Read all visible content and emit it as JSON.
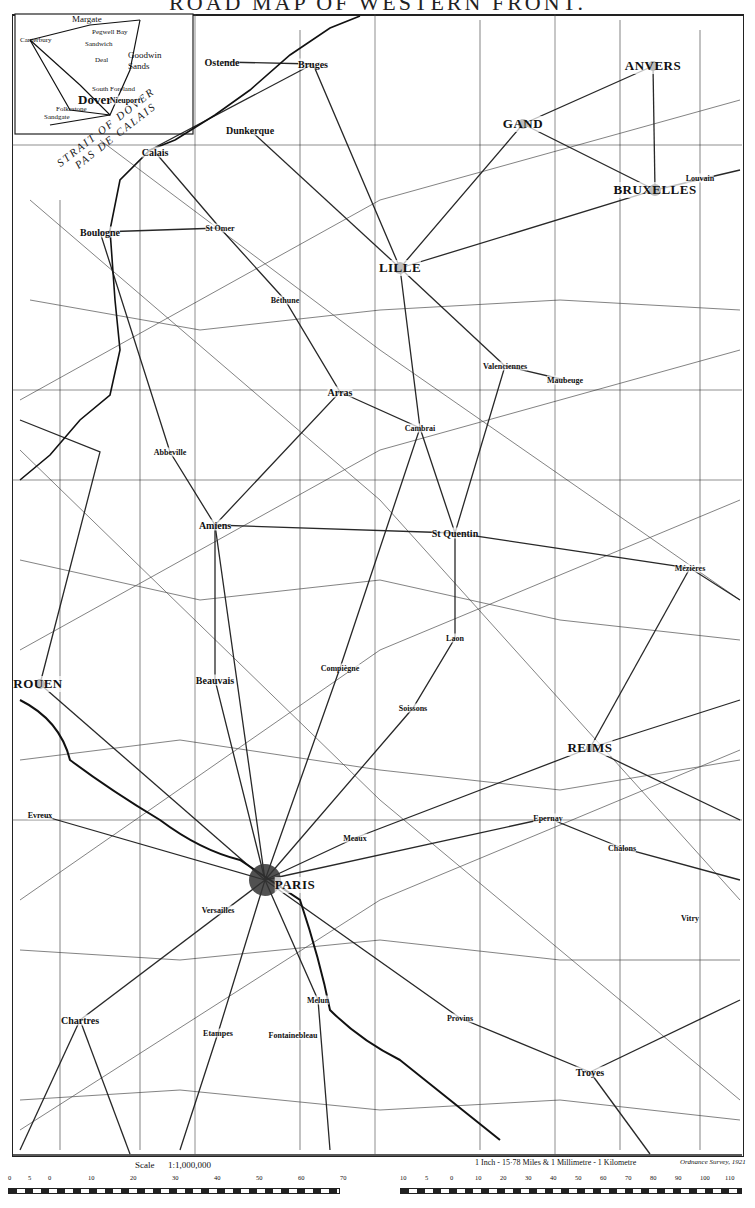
{
  "title": "ROAD MAP OF WESTERN FRONT.",
  "inset": {
    "labels": [
      "Margate",
      "Pegwell Bay",
      "Ramsgate",
      "Canterbury",
      "Sandwich",
      "Deal",
      "Goodwin Sands",
      "South Foreland",
      "Dover",
      "Folkestone",
      "Sandgate"
    ]
  },
  "sea_labels": {
    "strait_en": "STRAIT OF DOVER",
    "strait_fr": "PAS DE CALAIS"
  },
  "cities": [
    {
      "name": "Ostende",
      "x": 222,
      "y": 62,
      "size": "medium"
    },
    {
      "name": "Bruges",
      "x": 313,
      "y": 64,
      "size": "medium"
    },
    {
      "name": "ANVERS",
      "x": 653,
      "y": 66,
      "size": "major"
    },
    {
      "name": "GAND",
      "x": 523,
      "y": 124,
      "size": "major"
    },
    {
      "name": "Dunkerque",
      "x": 250,
      "y": 130,
      "size": "medium"
    },
    {
      "name": "Nieuport",
      "x": 125,
      "y": 100,
      "size": "small"
    },
    {
      "name": "Calais",
      "x": 155,
      "y": 152,
      "size": "medium"
    },
    {
      "name": "BRUXELLES",
      "x": 655,
      "y": 190,
      "size": "major"
    },
    {
      "name": "Louvain",
      "x": 700,
      "y": 178,
      "size": "small"
    },
    {
      "name": "Boulogne",
      "x": 100,
      "y": 232,
      "size": "medium"
    },
    {
      "name": "St Omer",
      "x": 220,
      "y": 228,
      "size": "small"
    },
    {
      "name": "LILLE",
      "x": 400,
      "y": 268,
      "size": "major"
    },
    {
      "name": "Béthune",
      "x": 285,
      "y": 300,
      "size": "small"
    },
    {
      "name": "Arras",
      "x": 340,
      "y": 392,
      "size": "medium"
    },
    {
      "name": "Valenciennes",
      "x": 505,
      "y": 366,
      "size": "small"
    },
    {
      "name": "Maubeuge",
      "x": 565,
      "y": 380,
      "size": "small"
    },
    {
      "name": "Cambrai",
      "x": 420,
      "y": 428,
      "size": "small"
    },
    {
      "name": "Abbeville",
      "x": 170,
      "y": 452,
      "size": "small"
    },
    {
      "name": "Amiens",
      "x": 215,
      "y": 525,
      "size": "medium"
    },
    {
      "name": "St Quentin",
      "x": 455,
      "y": 533,
      "size": "medium"
    },
    {
      "name": "Mézières",
      "x": 690,
      "y": 568,
      "size": "small"
    },
    {
      "name": "Laon",
      "x": 455,
      "y": 638,
      "size": "small"
    },
    {
      "name": "Soissons",
      "x": 413,
      "y": 708,
      "size": "small"
    },
    {
      "name": "ROUEN",
      "x": 38,
      "y": 684,
      "size": "major"
    },
    {
      "name": "Beauvais",
      "x": 215,
      "y": 680,
      "size": "medium"
    },
    {
      "name": "Compiègne",
      "x": 340,
      "y": 668,
      "size": "small"
    },
    {
      "name": "REIMS",
      "x": 590,
      "y": 748,
      "size": "major"
    },
    {
      "name": "Evreux",
      "x": 40,
      "y": 815,
      "size": "small"
    },
    {
      "name": "PARIS",
      "x": 295,
      "y": 885,
      "size": "major"
    },
    {
      "name": "Versailles",
      "x": 218,
      "y": 910,
      "size": "small"
    },
    {
      "name": "Meaux",
      "x": 355,
      "y": 838,
      "size": "small"
    },
    {
      "name": "Châlons",
      "x": 622,
      "y": 848,
      "size": "small"
    },
    {
      "name": "Epernay",
      "x": 548,
      "y": 818,
      "size": "small"
    },
    {
      "name": "Melun",
      "x": 318,
      "y": 1000,
      "size": "small"
    },
    {
      "name": "Chartres",
      "x": 80,
      "y": 1020,
      "size": "medium"
    },
    {
      "name": "Fontainebleau",
      "x": 293,
      "y": 1035,
      "size": "small"
    },
    {
      "name": "Troyes",
      "x": 590,
      "y": 1072,
      "size": "medium"
    },
    {
      "name": "Etampes",
      "x": 218,
      "y": 1033,
      "size": "small"
    },
    {
      "name": "Provins",
      "x": 460,
      "y": 1018,
      "size": "small"
    },
    {
      "name": "Vitry",
      "x": 690,
      "y": 918,
      "size": "small"
    }
  ],
  "scale": {
    "label": "Scale",
    "ratio": "1:1,000,000",
    "miles_ticks": [
      "0",
      "5",
      "0",
      "10",
      "20",
      "30",
      "40",
      "50",
      "60",
      "70"
    ],
    "km_ticks": [
      "10",
      "5",
      "0",
      "10",
      "20",
      "30",
      "40",
      "50",
      "60",
      "70",
      "80",
      "90",
      "100",
      "110"
    ],
    "note": "1 Inch - 15·78 Miles & 1 Millimetre - 1 Kilometre",
    "credit": "Ordnance Survey, 1921"
  },
  "colors": {
    "ink": "#111111",
    "paper": "#ffffff"
  }
}
